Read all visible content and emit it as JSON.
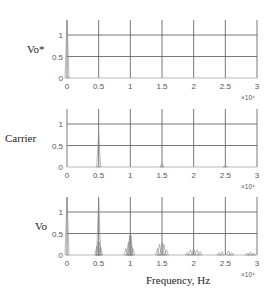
{
  "chart_data": [
    {
      "type": "line",
      "title": "",
      "ylabel": "Vo*",
      "xlabel": "",
      "x_multiplier": "×10⁴",
      "xlim": [
        0,
        3
      ],
      "ylim": [
        0,
        1.35
      ],
      "xticks": [
        "0",
        "0.5",
        "1",
        "1.5",
        "2",
        "2.5",
        "3"
      ],
      "yticks": [
        "0",
        "0.5",
        "1"
      ],
      "grid": true,
      "spikes": [
        {
          "x": 0.0,
          "y": 1.35
        }
      ]
    },
    {
      "type": "line",
      "title": "",
      "ylabel": "Carrier",
      "xlabel": "",
      "x_multiplier": "×10⁴",
      "xlim": [
        0,
        3
      ],
      "ylim": [
        0,
        1.35
      ],
      "xticks": [
        "0",
        "0.5",
        "1",
        "1.5",
        "2",
        "2.5",
        "3"
      ],
      "yticks": [
        "0",
        "0.5",
        "1"
      ],
      "grid": true,
      "spikes": [
        {
          "x": 0.5,
          "y": 0.8
        },
        {
          "x": 1.5,
          "y": 0.08
        },
        {
          "x": 2.5,
          "y": 0.03
        }
      ]
    },
    {
      "type": "line",
      "title": "",
      "ylabel": "Vo",
      "xlabel": "Frequency, Hz",
      "x_multiplier": "×10⁴",
      "xlim": [
        0,
        3
      ],
      "ylim": [
        0,
        1.35
      ],
      "xticks": [
        "0",
        "0.5",
        "1",
        "1.5",
        "2",
        "2.5",
        "3"
      ],
      "yticks": [
        "0",
        "0.5",
        "1"
      ],
      "grid": true,
      "spikes": [
        {
          "x": 0.0,
          "y": 1.35
        },
        {
          "x": 0.47,
          "y": 0.2
        },
        {
          "x": 0.49,
          "y": 0.3
        },
        {
          "x": 0.5,
          "y": 1.3
        },
        {
          "x": 0.51,
          "y": 0.3
        },
        {
          "x": 0.53,
          "y": 0.2
        },
        {
          "x": 0.93,
          "y": 0.15
        },
        {
          "x": 0.97,
          "y": 0.3
        },
        {
          "x": 0.99,
          "y": 0.45
        },
        {
          "x": 1.0,
          "y": 0.5
        },
        {
          "x": 1.01,
          "y": 0.45
        },
        {
          "x": 1.04,
          "y": 0.15
        },
        {
          "x": 1.43,
          "y": 0.15
        },
        {
          "x": 1.46,
          "y": 0.25
        },
        {
          "x": 1.5,
          "y": 0.3
        },
        {
          "x": 1.53,
          "y": 0.25
        },
        {
          "x": 1.57,
          "y": 0.12
        },
        {
          "x": 1.9,
          "y": 0.06
        },
        {
          "x": 1.95,
          "y": 0.12
        },
        {
          "x": 2.0,
          "y": 0.15
        },
        {
          "x": 2.05,
          "y": 0.12
        },
        {
          "x": 2.1,
          "y": 0.08
        },
        {
          "x": 2.4,
          "y": 0.06
        },
        {
          "x": 2.45,
          "y": 0.08
        },
        {
          "x": 2.55,
          "y": 0.1
        },
        {
          "x": 2.6,
          "y": 0.06
        },
        {
          "x": 2.85,
          "y": 0.05
        },
        {
          "x": 2.9,
          "y": 0.07
        },
        {
          "x": 2.95,
          "y": 0.04
        }
      ]
    }
  ]
}
